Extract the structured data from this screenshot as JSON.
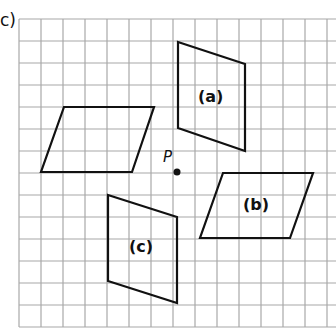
{
  "part_label": "c)",
  "point_label": "P",
  "grid": {
    "left": 19,
    "top": 19,
    "step": 22,
    "cols": 14,
    "rows": 14,
    "line_color": "#a8a8a8"
  },
  "point": {
    "x": 177,
    "y": 172
  },
  "shapes": [
    {
      "name": "original",
      "label": "",
      "points": [
        [
          64,
          107
        ],
        [
          154,
          107
        ],
        [
          132,
          172
        ],
        [
          41,
          172
        ]
      ]
    },
    {
      "name": "a",
      "label": "(a)",
      "points": [
        [
          178,
          42
        ],
        [
          245,
          64
        ],
        [
          245,
          151
        ],
        [
          178,
          128
        ]
      ],
      "label_pos": [
        198,
        90
      ]
    },
    {
      "name": "b",
      "label": "(b)",
      "points": [
        [
          223,
          173
        ],
        [
          313,
          173
        ],
        [
          290,
          238
        ],
        [
          200,
          238
        ]
      ],
      "label_pos": [
        243,
        196
      ]
    },
    {
      "name": "c",
      "label": "(c)",
      "points": [
        [
          108,
          195
        ],
        [
          177,
          217
        ],
        [
          177,
          303
        ],
        [
          108,
          281
        ]
      ],
      "label_pos": [
        130,
        238
      ]
    }
  ]
}
